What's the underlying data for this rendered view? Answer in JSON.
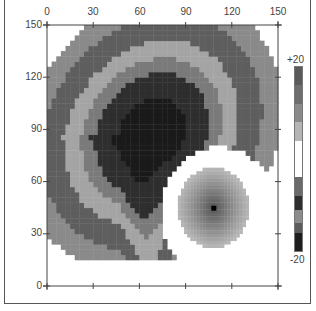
{
  "chart_data": {
    "type": "heatmap",
    "title": "",
    "xlabel": "",
    "ylabel": "",
    "xlim": [
      0,
      150
    ],
    "ylim": [
      0,
      150
    ],
    "x_ticks": [
      "0",
      "30",
      "60",
      "90",
      "120",
      "150"
    ],
    "y_ticks": [
      "0",
      "30",
      "60",
      "90",
      "120",
      "150"
    ],
    "colorbar": {
      "max_label": "+20",
      "min_label": "-20",
      "range": [
        -20,
        20
      ],
      "segments": [
        {
          "from": 20,
          "to": 16,
          "color": "#5a5a5a"
        },
        {
          "from": 16,
          "to": 12,
          "color": "#6e6e6e"
        },
        {
          "from": 12,
          "to": 8,
          "color": "#8a8a8a"
        },
        {
          "from": 8,
          "to": 4,
          "color": "#b5b5b5"
        },
        {
          "from": 4,
          "to": -4,
          "color": "#ffffff"
        },
        {
          "from": -4,
          "to": -8,
          "color": "#6a6a6a"
        },
        {
          "from": -8,
          "to": -11,
          "color": "#2e2e2e"
        },
        {
          "from": -11,
          "to": -14,
          "color": "#8c8c8c"
        },
        {
          "from": -14,
          "to": -16,
          "color": "#5c5c5c"
        },
        {
          "from": -16,
          "to": -20,
          "color": "#1e1e1e"
        }
      ]
    },
    "features": [
      {
        "name": "large crescent region (negative)",
        "center": [
          68,
          88
        ],
        "bands_outer_to_inner": [
          {
            "color": "#8a8a8a"
          },
          {
            "color": "#5e5e5e"
          },
          {
            "color": "#a4a4a4"
          },
          {
            "color": "#7a7a7a"
          },
          {
            "color": "#2e2e2e"
          },
          {
            "color": "#1a1a1a"
          }
        ],
        "extent_x": [
          0,
          150
        ],
        "extent_y": [
          14,
          150
        ]
      },
      {
        "name": "small circular region (positive)",
        "center": [
          108,
          45
        ],
        "radius": 23,
        "peak_marker": [
          108,
          45
        ],
        "color_edge": "#b0b0b0",
        "color_center": "#555555"
      }
    ],
    "grid": false,
    "legend_position": "right (colorbar)"
  }
}
